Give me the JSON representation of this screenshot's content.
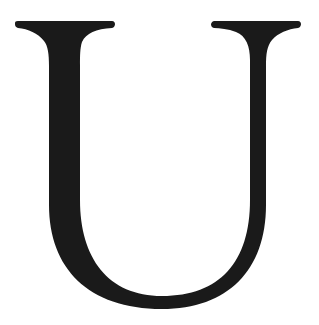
{
  "glyph": {
    "character": "U",
    "style": "serif capital letter",
    "color": "#1a1a1a",
    "background": "#ffffff"
  }
}
